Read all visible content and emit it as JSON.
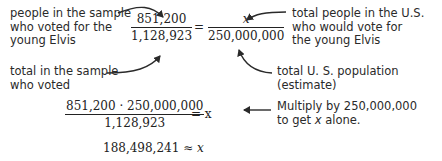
{
  "proportion": {
    "left_fraction": {
      "numerator": "851,200",
      "denominator": "1,128,923"
    },
    "equals": "=",
    "right_fraction": {
      "numerator": "x",
      "denominator": "250,000,000"
    }
  },
  "annotations": {
    "sample_voted_elvis": [
      "people in the sample",
      "who voted for the",
      "young Elvis"
    ],
    "sample_total": [
      "total in the sample",
      "who voted"
    ],
    "us_voted_elvis": [
      "total people in the U.S.",
      "who would vote for",
      "the young Elvis"
    ],
    "us_population": [
      "total U. S. population",
      "(estimate)"
    ],
    "multiply_note": [
      "Multiply by 250,000,000",
      "to get x alone."
    ]
  },
  "step2": {
    "numerator": "851,200 · 250,000,000",
    "denominator": "1,128,923",
    "rhs": "= x"
  },
  "result": {
    "value": "188,498,241",
    "relation": "≈",
    "variable": "x"
  }
}
